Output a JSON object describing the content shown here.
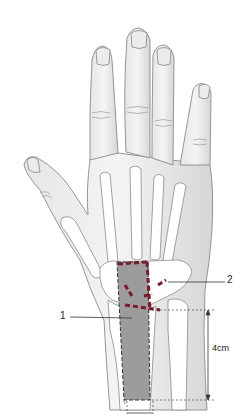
{
  "figure": {
    "labels": [
      {
        "id": "1",
        "text": "1"
      },
      {
        "id": "2",
        "text": "2"
      }
    ],
    "dimension": {
      "text": "4cm"
    },
    "colors": {
      "skin_outline": "#8a8a8a",
      "bone_fill": "#ffffff",
      "graft_region_fill": "#9c9c9c",
      "dashed_marker": "#7a1a2a",
      "leader_line": "#333333"
    }
  }
}
